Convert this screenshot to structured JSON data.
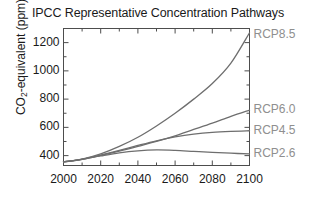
{
  "chart_data": {
    "type": "line",
    "title": "IPCC Representative Concentration Pathways",
    "xlabel": "",
    "ylabel": "CO2-equivalent (ppm)",
    "ylabel_prefix": "CO",
    "ylabel_sub": "2",
    "ylabel_suffix": "-equivalent (ppm)",
    "xlim": [
      2000,
      2100
    ],
    "ylim": [
      330,
      1300
    ],
    "grid": false,
    "legend_position": "right-inline",
    "xticks": [
      2000,
      2020,
      2040,
      2060,
      2080,
      2100
    ],
    "xtick_labels": [
      "2000",
      "2020",
      "2040",
      "2060",
      "2080",
      "2100"
    ],
    "x_minor_ticks": [
      2010,
      2030,
      2050,
      2070,
      2090
    ],
    "yticks": [
      400,
      600,
      800,
      1000,
      1200
    ],
    "ytick_labels": [
      "400",
      "600",
      "800",
      "1000",
      "1200"
    ],
    "y_minor_ticks": [
      500,
      700,
      900,
      1100
    ],
    "x": [
      2000,
      2010,
      2020,
      2030,
      2040,
      2050,
      2060,
      2070,
      2080,
      2090,
      2100
    ],
    "series": [
      {
        "name": "RCP8.5",
        "label": "RCP8.5",
        "color": "#6e6e6e",
        "values": [
          355,
          375,
          412,
          465,
          530,
          610,
          700,
          800,
          910,
          1055,
          1270
        ],
        "end_value": 1270
      },
      {
        "name": "RCP6.0",
        "label": "RCP6.0",
        "color": "#6e6e6e",
        "values": [
          355,
          374,
          402,
          432,
          465,
          500,
          540,
          585,
          630,
          678,
          722
        ],
        "end_value": 722
      },
      {
        "name": "RCP4.5",
        "label": "RCP4.5",
        "color": "#6e6e6e",
        "values": [
          355,
          375,
          404,
          437,
          472,
          505,
          532,
          552,
          565,
          572,
          576
        ],
        "end_value": 576
      },
      {
        "name": "RCP2.6",
        "label": "RCP2.6",
        "color": "#6e6e6e",
        "values": [
          355,
          374,
          398,
          420,
          434,
          440,
          437,
          430,
          423,
          417,
          412
        ],
        "end_value": 412
      }
    ],
    "axis_color": "#4d4d4d",
    "text_color": "#1a1a1a",
    "label_color": "#8f8f8f"
  }
}
